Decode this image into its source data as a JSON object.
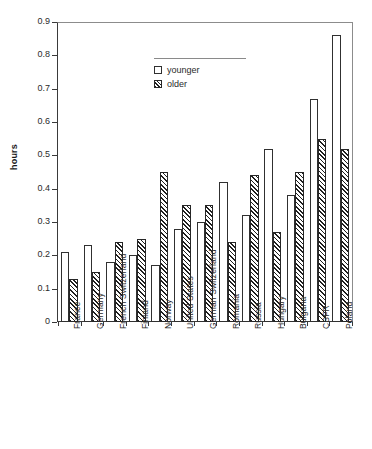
{
  "chart_data": {
    "type": "bar",
    "title": "",
    "xlabel": "",
    "ylabel": "hours",
    "ylim": [
      0,
      0.9
    ],
    "ytick_labels": [
      "0.9",
      "0.8",
      "0.7",
      "0.6",
      "0.5",
      "0.4",
      "0.3",
      "0.2",
      "0.1",
      "0"
    ],
    "ytick_values": [
      0.9,
      0.8,
      0.7,
      0.6,
      0.5,
      0.4,
      0.3,
      0.2,
      0.1,
      0
    ],
    "grid": false,
    "legend_position": "upper-center",
    "categories": [
      "France",
      "Germany",
      "French Switzerland",
      "Finland",
      "Norway",
      "United States",
      "German Switzerland",
      "Romania",
      "Russia",
      "Hungary",
      "Bulgaria",
      "CSFR",
      "Poland"
    ],
    "series": [
      {
        "name": "younger",
        "values": [
          0.21,
          0.23,
          0.18,
          0.2,
          0.17,
          0.28,
          0.3,
          0.42,
          0.32,
          0.52,
          0.38,
          0.67,
          0.86
        ]
      },
      {
        "name": "older",
        "values": [
          0.13,
          0.15,
          0.24,
          0.25,
          0.45,
          0.35,
          0.35,
          0.24,
          0.44,
          0.27,
          0.45,
          0.55,
          0.52
        ]
      }
    ]
  },
  "legend": {
    "entries": [
      {
        "label": "younger",
        "style": "open"
      },
      {
        "label": "older",
        "style": "hatched"
      }
    ]
  },
  "axes": {
    "y_title": "hours"
  },
  "caption": {
    "text": ""
  },
  "colors": {
    "axis": "#3a3a3a",
    "bar_outline": "#303030",
    "hatch": "#1f1f1f",
    "background": "#ffffff",
    "text": "#2b2b2b"
  }
}
